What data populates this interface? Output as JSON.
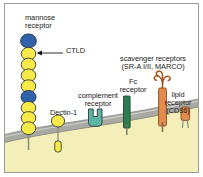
{
  "figure": {
    "border_color": "#9c9c96",
    "background": "#ffffff"
  },
  "cell": {
    "membrane_color": "#a9a9a4",
    "membrane_highlight": "#d9d9d4",
    "cytoplasm_color": "#f4efb8",
    "cytoplasm_edge": "#8f8f86"
  },
  "labels": {
    "mannose_receptor": "mannose\nreceptor",
    "ctld": "CTLD",
    "dectin1": "Dectin-1",
    "complement_receptor": "complement\nreceptor",
    "fc_receptor": "Fc\nreceptor",
    "scavenger_receptors": "scavenger receptors\n(SR-A I/II, MARCO)",
    "lipid_receptor": "lipid\nreceptor\n(CD36)"
  },
  "receptors": [
    {
      "name": "mannose-receptor",
      "label": "mannose receptor",
      "domain_label": "CTLD",
      "bead_count": 10,
      "bead_colors": [
        "#2f62a8",
        "#f6e94a",
        "#f6e94a",
        "#f6e94a",
        "#f6e94a",
        "#2f62a8",
        "#f6e94a",
        "#f6e94a",
        "#f6e94a",
        "#f6e94a"
      ],
      "bead_outline": "#3a3a32",
      "stalk_color": "#a2a29a"
    },
    {
      "name": "dectin-1",
      "label": "Dectin-1",
      "head_color": "#f6e94a",
      "tail_color": "#f6e94a",
      "outline": "#3a3a32"
    },
    {
      "name": "complement-receptor",
      "label": "complement receptor",
      "color": "#5bb5a2",
      "outline": "#2f3a35"
    },
    {
      "name": "fc-receptor",
      "label": "Fc receptor",
      "color": "#2f7d4f",
      "outline": "#1d4a30"
    },
    {
      "name": "scavenger-receptor",
      "label": "scavenger receptors (SR-A I/II, MARCO)",
      "color": "#e38c4e",
      "outline": "#8a4a1c",
      "head_shape": "trident-curl"
    },
    {
      "name": "lipid-receptor",
      "label": "lipid receptor (CD36)",
      "color": "#e38c4e",
      "outline": "#8a4a1c"
    }
  ],
  "colors": {
    "yellow_bead": "#f6e94a",
    "blue_bead": "#2f62a8",
    "teal": "#5bb5a2",
    "green": "#2f7d4f",
    "orange": "#e38c4e",
    "membrane_gray": "#a9a9a4",
    "cytoplasm": "#f4efb8",
    "text": "#1a1a1a"
  }
}
